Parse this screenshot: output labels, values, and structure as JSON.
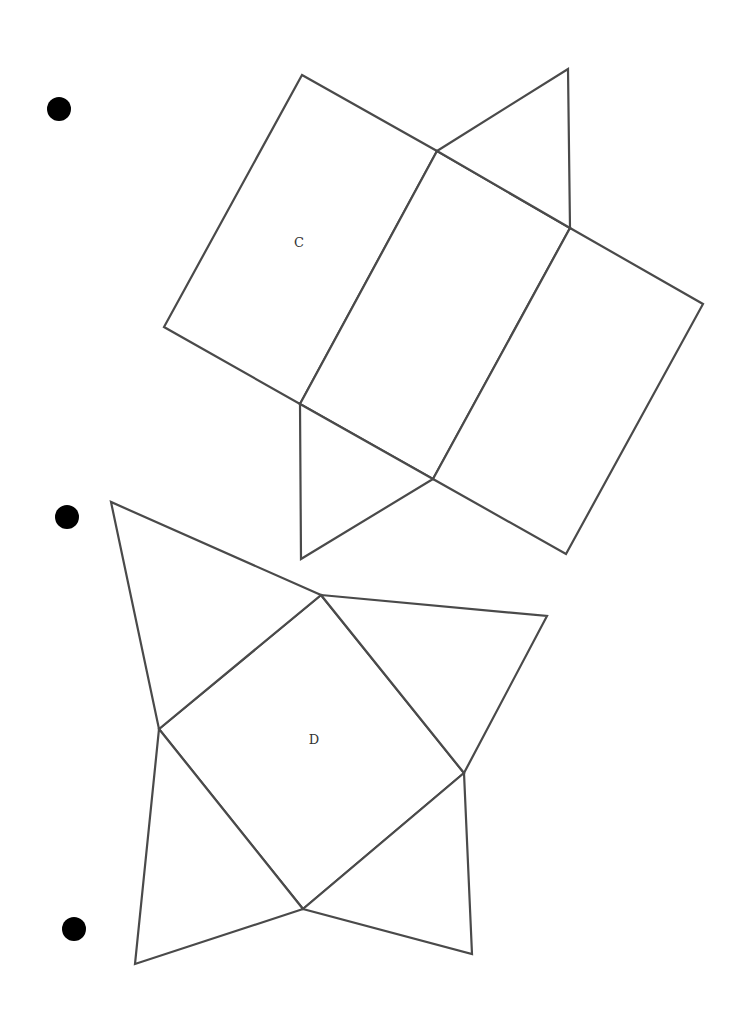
{
  "page": {
    "width": 755,
    "height": 1020,
    "background": "#ffffff",
    "line_color": "#4a4a4a"
  },
  "bullets": [
    {
      "cx": 59,
      "cy": 109,
      "r": 12
    },
    {
      "cx": 67,
      "cy": 517,
      "r": 12
    },
    {
      "cx": 74,
      "cy": 929,
      "r": 12
    }
  ],
  "nets": {
    "c": {
      "label": "C",
      "label_pos": {
        "x": 299,
        "y": 243
      },
      "description": "triangular prism net",
      "faces": [
        {
          "name": "rectangle-1",
          "points": "302,75 437,151 300,404 164,327"
        },
        {
          "name": "rectangle-2",
          "points": "437,151 570,228 433,479 300,404"
        },
        {
          "name": "rectangle-3",
          "points": "570,228 703,304 566,554 433,479"
        },
        {
          "name": "triangle-top",
          "points": "437,151 568,69 570,228"
        },
        {
          "name": "triangle-bottom",
          "points": "300,404 433,479 301,559"
        }
      ]
    },
    "d": {
      "label": "D",
      "label_pos": {
        "x": 314,
        "y": 740
      },
      "description": "square pyramid net",
      "faces": [
        {
          "name": "square-base",
          "points": "321,595 464,773 303,909 159,729"
        },
        {
          "name": "triangle-top-left",
          "points": "321,595 111,502 159,729"
        },
        {
          "name": "triangle-right",
          "points": "321,595 547,616 464,773"
        },
        {
          "name": "triangle-bottom-right",
          "points": "464,773 472,954 303,909"
        },
        {
          "name": "triangle-bottom-left",
          "points": "303,909 135,964 159,729"
        }
      ]
    }
  }
}
